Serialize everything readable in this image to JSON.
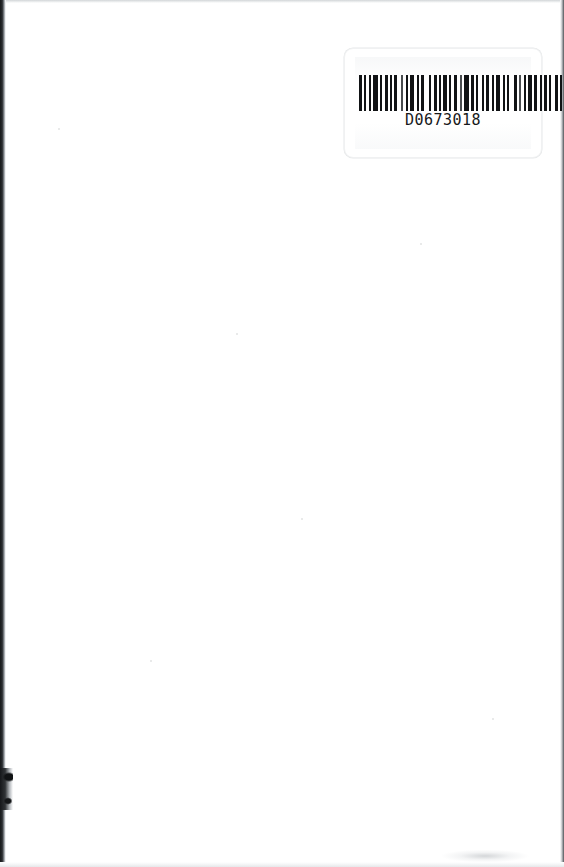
{
  "document": {
    "kind": "scanned-book-page",
    "page_background_color": "#ffffff",
    "page_width": 564,
    "page_height": 867,
    "content_note": "blank page"
  },
  "barcode_label": {
    "name": "library-barcode-label",
    "number": "D0673018",
    "symbology": "code-39",
    "label_background_color": "#ffffff",
    "bar_color": "#111315",
    "border_color": "#f0f1f2",
    "position": {
      "left": 344,
      "top": 48,
      "width": 196,
      "height": 108
    },
    "bar_pattern": [
      3,
      2,
      2,
      3,
      2,
      2,
      5,
      2,
      2,
      3,
      3,
      2,
      2,
      2,
      3,
      4,
      2,
      3,
      2,
      2,
      4,
      3,
      2,
      2,
      3,
      5,
      2,
      3,
      3,
      2,
      2,
      2,
      4,
      2,
      2,
      3,
      3,
      3,
      2,
      2,
      5,
      2,
      3,
      2,
      2,
      4,
      2,
      2,
      3,
      3,
      2,
      2,
      4,
      3,
      2,
      2,
      2,
      5,
      3,
      2,
      2,
      3,
      2,
      2,
      4,
      2,
      3,
      3,
      2,
      2,
      3,
      2,
      2,
      4,
      3,
      2,
      2,
      2,
      3,
      3
    ]
  },
  "scan_artifacts": {
    "left_edge": {
      "name": "left-binding-shadow",
      "color": "#16181a",
      "width": 6
    },
    "left_notch": {
      "name": "left-edge-notch",
      "top": 768,
      "height": 42
    },
    "right_edge": {
      "name": "right-page-edge",
      "color": "#4e5255",
      "width": 4
    },
    "top_edge": {
      "name": "top-page-edge",
      "color": "#d2d5d8"
    },
    "bottom_edge": {
      "name": "bottom-page-edge",
      "color": "#e6e8ea"
    },
    "specks": [
      {
        "left": 58,
        "top": 128,
        "size": 2
      },
      {
        "left": 236,
        "top": 333,
        "size": 2
      },
      {
        "left": 301,
        "top": 518,
        "size": 2
      },
      {
        "left": 420,
        "top": 243,
        "size": 2
      },
      {
        "left": 150,
        "top": 660,
        "size": 2
      },
      {
        "left": 492,
        "top": 718,
        "size": 2
      }
    ]
  }
}
